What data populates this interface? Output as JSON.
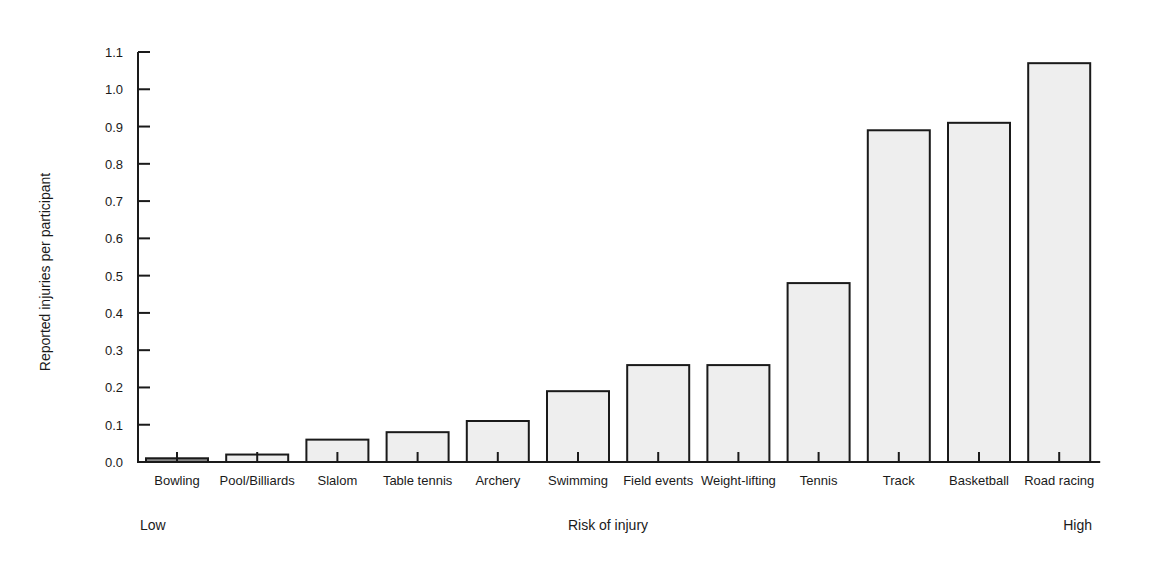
{
  "chart_data": {
    "type": "bar",
    "title": "",
    "xlabel": "Risk of injury",
    "ylabel": "Reported injuries per participant",
    "x_scale_labels": {
      "low": "Low",
      "high": "High"
    },
    "categories": [
      "Bowling",
      "Pool/Billiards",
      "Slalom",
      "Table tennis",
      "Archery",
      "Swimming",
      "Field events",
      "Weight-lifting",
      "Tennis",
      "Track",
      "Basketball",
      "Road racing"
    ],
    "values": [
      0.01,
      0.02,
      0.06,
      0.08,
      0.11,
      0.19,
      0.26,
      0.26,
      0.48,
      0.89,
      0.91,
      1.07
    ],
    "ylim": [
      0.0,
      1.1
    ],
    "yticks": [
      "0.0",
      "0.1",
      "0.2",
      "0.3",
      "0.4",
      "0.5",
      "0.6",
      "0.7",
      "0.8",
      "0.9",
      "1.0",
      "1.1"
    ],
    "grid": false,
    "legend": null
  },
  "colors": {
    "bar_fill": "#eeeeee",
    "bar_fill_dark": "#888888",
    "stroke": "#1a1a1a"
  }
}
